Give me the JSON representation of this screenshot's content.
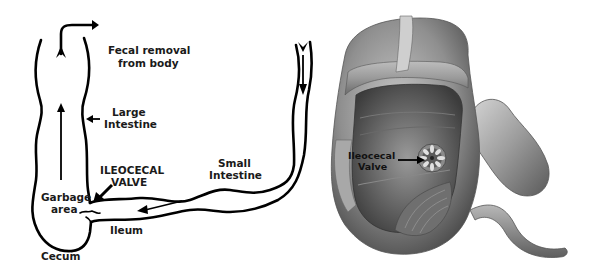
{
  "left_diagram": {
    "title": "Schematic of small intestine joining large intestine",
    "labels": {
      "fecal_removal_line1": "Fecal removal",
      "fecal_removal_line2": "from body",
      "large_intestine_line1": "Large",
      "large_intestine_line2": "Intestine",
      "ileocecal_valve_line1": "ILEOCECAL",
      "ileocecal_valve_line2": "VALVE",
      "small_intestine_line1": "Small",
      "small_intestine_line2": "Intestine",
      "garbage_area_line1": "Garbage",
      "garbage_area_line2": "area",
      "ileum": "Ileum",
      "cecum": "Cecum"
    }
  },
  "right_illustration": {
    "title": "Cutaway illustration of cecum showing ileocecal valve",
    "labels": {
      "ileocecal_valve_line1": "Ileocecal",
      "ileocecal_valve_line2": "Valve"
    }
  },
  "colors": {
    "ink": "#000000",
    "background": "#ffffff",
    "tissue_light": "#c8c8c8",
    "tissue_mid": "#8e8e8e",
    "tissue_dark": "#4a4a4a"
  }
}
